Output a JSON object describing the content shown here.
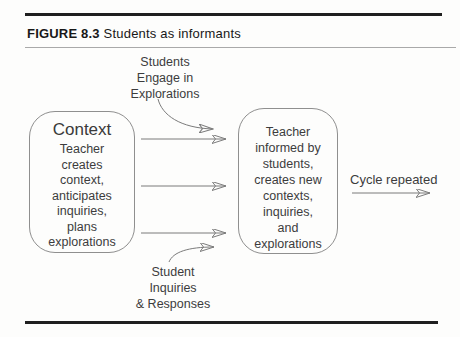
{
  "header": {
    "figure_label": "FIGURE 8.3",
    "figure_title": "Students as informants"
  },
  "diagram": {
    "top_label": {
      "lines": [
        "Students",
        "Engage in",
        "Explorations"
      ]
    },
    "bottom_label": {
      "lines": [
        "Student",
        "Inquiries",
        "& Responses"
      ]
    },
    "left_box": {
      "title": "Context",
      "lines": [
        "Teacher",
        "creates",
        "context,",
        "anticipates",
        "inquiries,",
        "plans",
        "explorations"
      ]
    },
    "right_box": {
      "lines": [
        "Teacher",
        "informed by",
        "students,",
        "creates new",
        "contexts,",
        "inquiries,",
        "and",
        "explorations"
      ]
    },
    "cycle_label": "Cycle repeated",
    "colors": {
      "line": "#7b7b7b",
      "arrowhead": "#161616",
      "text": "#3c3c3c",
      "rule": "#1f1f1f"
    }
  }
}
